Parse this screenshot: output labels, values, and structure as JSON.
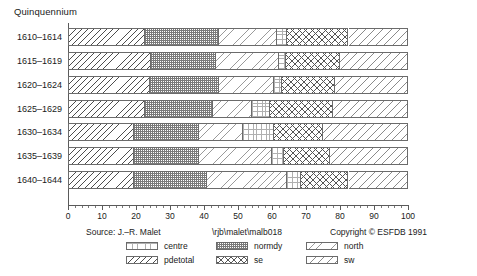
{
  "chart_data": {
    "type": "bar",
    "orientation": "horizontal",
    "stacked": true,
    "normalized": true,
    "title": "Quinquennium",
    "xlabel": "",
    "ylabel": "Quinquennium",
    "xlim": [
      0,
      100
    ],
    "xticks": [
      0,
      10,
      20,
      30,
      40,
      50,
      60,
      70,
      80,
      90,
      100
    ],
    "xtick_labels": [
      "0",
      "10",
      "20",
      "30",
      "40",
      "50",
      "60",
      "70",
      "80",
      "90",
      "100"
    ],
    "grid": false,
    "legend_position": "bottom",
    "categories": [
      "1610–1614",
      "1615–1619",
      "1620–1624",
      "1625–1629",
      "1630–1634",
      "1635–1639",
      "1640–1644"
    ],
    "series": [
      {
        "name": "pdetotal",
        "pattern": "diagonal-back",
        "values": [
          22.5,
          24.5,
          24.0,
          22.5,
          19.5,
          19.5,
          19.5
        ]
      },
      {
        "name": "normdy",
        "pattern": "fine-checker",
        "values": [
          22.0,
          19.0,
          20.5,
          20.0,
          19.0,
          19.0,
          21.5
        ]
      },
      {
        "name": "north",
        "pattern": "light-diagonal",
        "values": [
          17.0,
          18.5,
          16.0,
          11.5,
          13.0,
          21.5,
          23.5
        ]
      },
      {
        "name": "centre",
        "pattern": "sparse-dots",
        "values": [
          3.0,
          2.0,
          2.5,
          5.5,
          9.0,
          3.5,
          4.0
        ]
      },
      {
        "name": "se",
        "pattern": "cross-hatch",
        "values": [
          18.0,
          16.0,
          15.5,
          18.5,
          14.5,
          13.5,
          14.0
        ]
      },
      {
        "name": "sw",
        "pattern": "wide-diagonal",
        "values": [
          17.5,
          20.0,
          21.5,
          22.0,
          25.0,
          23.0,
          17.5
        ]
      }
    ]
  },
  "footer": {
    "source": "Source: J.–R. Malet",
    "path": "\\rjb\\malet\\malb018",
    "copyright": "Copyright © ESFDB 1991"
  },
  "legend": {
    "items": [
      {
        "label": "centre",
        "pattern": "sparse-dots"
      },
      {
        "label": "normdy",
        "pattern": "fine-checker"
      },
      {
        "label": "north",
        "pattern": "light-diagonal"
      },
      {
        "label": "pdetotal",
        "pattern": "diagonal-back"
      },
      {
        "label": "se",
        "pattern": "cross-hatch"
      },
      {
        "label": "sw",
        "pattern": "wide-diagonal"
      }
    ]
  },
  "colors": {
    "background": "#ffffff",
    "axis": "#5a5a5a",
    "segment_border": "#6b6b6b",
    "text": "#1a1a1a"
  }
}
